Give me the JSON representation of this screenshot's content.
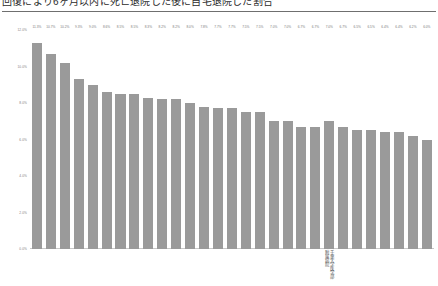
{
  "header": {
    "title": "回復により6ヶ月以内に死亡退院した後に自宅退院した割合",
    "divider_color": "#6f6f6f"
  },
  "chart_data": {
    "type": "bar",
    "title": "回復により6ヶ月以内に死亡退院した後に自宅退院した割合",
    "xlabel": "",
    "ylabel": "",
    "ylim": [
      0,
      12
    ],
    "grid": false,
    "legend": "none",
    "bar_color": "#9a9a9a",
    "value_label_format": "percent_1dp",
    "y_ticks": [
      "0.0%",
      "2.0%",
      "4.0%",
      "6.0%",
      "8.0%",
      "10.0%",
      "12.0%"
    ],
    "y_tick_values": [
      0,
      2,
      4,
      6,
      8,
      10,
      12
    ],
    "categories": [
      "",
      "",
      "",
      "",
      "",
      "",
      "",
      "",
      "",
      "",
      "",
      "",
      "",
      "",
      "",
      "",
      "",
      "",
      "",
      "",
      "",
      "千葉大学医学部附属病院",
      "",
      "",
      "",
      "",
      "",
      "",
      ""
    ],
    "values": [
      11.3,
      10.7,
      10.2,
      9.3,
      9.0,
      8.6,
      8.5,
      8.5,
      8.3,
      8.2,
      8.2,
      8.0,
      7.8,
      7.7,
      7.7,
      7.5,
      7.5,
      7.0,
      7.0,
      6.7,
      6.7,
      7.0,
      6.7,
      6.5,
      6.5,
      6.4,
      6.4,
      6.2,
      6.0
    ],
    "value_labels": [
      "11.3%",
      "10.7%",
      "10.2%",
      "9.3%",
      "9.0%",
      "8.6%",
      "8.5%",
      "8.5%",
      "8.3%",
      "8.2%",
      "8.2%",
      "8.0%",
      "7.8%",
      "7.7%",
      "7.7%",
      "7.5%",
      "7.5%",
      "7.0%",
      "7.0%",
      "6.7%",
      "6.7%",
      "7.0%",
      "6.7%",
      "6.5%",
      "6.5%",
      "6.4%",
      "6.4%",
      "6.2%",
      "6.0%"
    ],
    "highlight_index": 21,
    "highlight_label_lines": [
      "千葉大学医学部",
      "附属病院"
    ]
  }
}
